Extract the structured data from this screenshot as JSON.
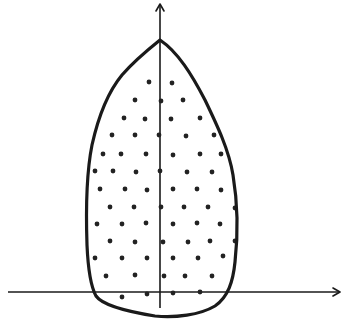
{
  "diagram": {
    "colors": {
      "stroke": "#1a1a1a",
      "dot": "#222222",
      "background": "#ffffff"
    },
    "axes": {
      "x_axis": {
        "x1": 8,
        "y1": 292,
        "x2": 340,
        "y2": 292,
        "arrow": "right"
      },
      "y_axis": {
        "x1": 160,
        "y1": 308,
        "x2": 160,
        "y2": 4,
        "arrow": "up"
      }
    },
    "region": {
      "shape": "teardrop",
      "apex": [
        160,
        40
      ],
      "fill_pattern": "dots"
    },
    "dots": [
      [
        149,
        82
      ],
      [
        172,
        83
      ],
      [
        135,
        100
      ],
      [
        161,
        101
      ],
      [
        183,
        100
      ],
      [
        124,
        118
      ],
      [
        145,
        119
      ],
      [
        171,
        119
      ],
      [
        200,
        118
      ],
      [
        112,
        135
      ],
      [
        135,
        135
      ],
      [
        159,
        135
      ],
      [
        186,
        136
      ],
      [
        214,
        135
      ],
      [
        103,
        154
      ],
      [
        121,
        154
      ],
      [
        146,
        154
      ],
      [
        173,
        155
      ],
      [
        200,
        154
      ],
      [
        221,
        154
      ],
      [
        95,
        171
      ],
      [
        113,
        171
      ],
      [
        136,
        172
      ],
      [
        160,
        171
      ],
      [
        187,
        172
      ],
      [
        212,
        172
      ],
      [
        100,
        189
      ],
      [
        125,
        189
      ],
      [
        147,
        190
      ],
      [
        173,
        189
      ],
      [
        197,
        189
      ],
      [
        221,
        190
      ],
      [
        110,
        207
      ],
      [
        134,
        207
      ],
      [
        161,
        207
      ],
      [
        184,
        207
      ],
      [
        208,
        207
      ],
      [
        235,
        208
      ],
      [
        97,
        224
      ],
      [
        122,
        224
      ],
      [
        146,
        223
      ],
      [
        173,
        224
      ],
      [
        197,
        223
      ],
      [
        220,
        224
      ],
      [
        110,
        241
      ],
      [
        135,
        242
      ],
      [
        163,
        242
      ],
      [
        188,
        242
      ],
      [
        210,
        241
      ],
      [
        235,
        241
      ],
      [
        95,
        258
      ],
      [
        122,
        258
      ],
      [
        147,
        258
      ],
      [
        173,
        258
      ],
      [
        198,
        258
      ],
      [
        223,
        256
      ],
      [
        106,
        276
      ],
      [
        135,
        275
      ],
      [
        164,
        276
      ],
      [
        185,
        276
      ],
      [
        212,
        276
      ],
      [
        122,
        297
      ],
      [
        147,
        294
      ],
      [
        173,
        293
      ],
      [
        200,
        292
      ]
    ]
  }
}
